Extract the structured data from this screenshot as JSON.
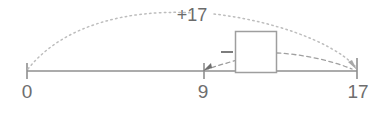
{
  "figure": {
    "type": "number-line-jump-diagram",
    "background_color": "#ffffff",
    "line_color": "#8f8f8f",
    "dotted_color": "#b9b9b9",
    "dashed_color": "#9a9a9a",
    "box_color": "#9a9a9a",
    "text_color": "#6e6e6e"
  },
  "number_line": {
    "start_value": "0",
    "end_value": "17",
    "ticks": [
      {
        "label": "0",
        "value": 0,
        "x": 27
      },
      {
        "label": "9",
        "value": 9,
        "x": 204
      },
      {
        "label": "17",
        "value": 17,
        "x": 357
      }
    ],
    "baseline_y": 71
  },
  "arcs": [
    {
      "name": "total-jump-arc",
      "label": "+17",
      "from": "0",
      "to": "17",
      "style": "dotted",
      "direction": "forward",
      "has_arrowhead": true,
      "label_x": 192,
      "label_y": 21
    },
    {
      "name": "back-jump-arc",
      "label": "",
      "from": "box",
      "to": "9",
      "style": "dashed",
      "direction": "backward",
      "has_arrowhead": true
    },
    {
      "name": "box-to-end-arc",
      "label": "",
      "from": "box",
      "to": "17",
      "style": "dashed",
      "direction": "forward",
      "has_arrowhead": false
    }
  ],
  "answer_box": {
    "name": "missing-value-box",
    "value": "",
    "sign": "−",
    "x": 235,
    "y": 31,
    "width": 41,
    "height": 42
  }
}
